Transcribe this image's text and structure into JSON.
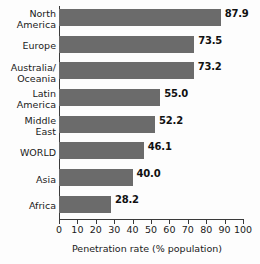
{
  "chart_data": {
    "type": "bar",
    "orientation": "horizontal",
    "title": "",
    "xlabel": "Penetration rate (% population)",
    "ylabel": "",
    "xlim": [
      0,
      100
    ],
    "xticks": [
      0,
      10,
      20,
      30,
      40,
      50,
      60,
      70,
      80,
      90,
      100
    ],
    "xtick_labels": [
      "0",
      "10",
      "20",
      "30",
      "40",
      "50",
      "60",
      "70",
      "80",
      "90",
      "100"
    ],
    "grid": false,
    "legend": false,
    "bar_color": "#6b6b6b",
    "categories": [
      "North America",
      "Europe",
      "Australia/Oceania",
      "Latin America",
      "Middle East",
      "WORLD",
      "Asia",
      "Africa"
    ],
    "category_lines": [
      [
        "North",
        "America"
      ],
      [
        "Europe"
      ],
      [
        "Australia/",
        "Oceania"
      ],
      [
        "Latin",
        "America"
      ],
      [
        "Middle",
        "East"
      ],
      [
        "WORLD"
      ],
      [
        "Asia"
      ],
      [
        "Africa"
      ]
    ],
    "values": [
      87.9,
      73.5,
      73.2,
      55.0,
      52.2,
      46.1,
      40.0,
      28.2
    ],
    "value_labels": [
      "87.9",
      "73.5",
      "73.2",
      "55.0",
      "52.2",
      "46.1",
      "40.0",
      "28.2"
    ]
  }
}
